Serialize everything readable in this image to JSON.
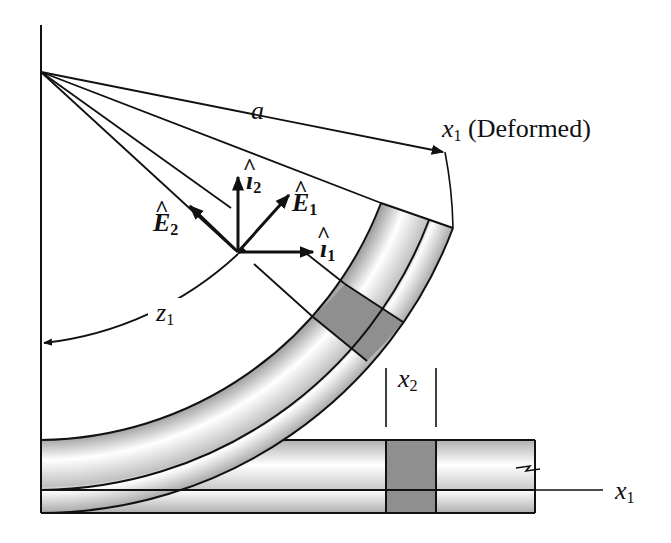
{
  "figure": {
    "type": "diagram",
    "colors": {
      "line": "#111111",
      "beam_light": "#ffffff",
      "beam_dark": "#a8a8a8",
      "element_fill": "#8f8f8f"
    }
  },
  "labels": {
    "a": {
      "main": "a"
    },
    "x1_deformed": {
      "main": "x",
      "sub": "1",
      "suffix": "(Deformed)"
    },
    "i2": {
      "main": "ı",
      "sub": "2"
    },
    "E1": {
      "main": "E",
      "sub": "1"
    },
    "E2": {
      "main": "E",
      "sub": "2"
    },
    "i1": {
      "main": "ı",
      "sub": "1"
    },
    "z1": {
      "main": "z",
      "sub": "1"
    },
    "x2": {
      "main": "x",
      "sub": "2"
    },
    "x1": {
      "main": "x",
      "sub": "1"
    }
  }
}
